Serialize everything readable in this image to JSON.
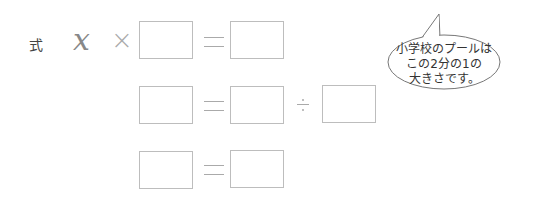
{
  "equation": {
    "label": "式",
    "variable": "x",
    "times": "×"
  },
  "rows": [
    {
      "boxes": 2,
      "operators": [
        "×",
        "="
      ]
    },
    {
      "boxes": 3,
      "operators": [
        "=",
        "÷"
      ]
    },
    {
      "boxes": 2,
      "operators": [
        "="
      ]
    }
  ],
  "speech_bubble": {
    "line1": "小学校のプールは",
    "line2": "この2分の1の",
    "line3": "大きさです。"
  }
}
